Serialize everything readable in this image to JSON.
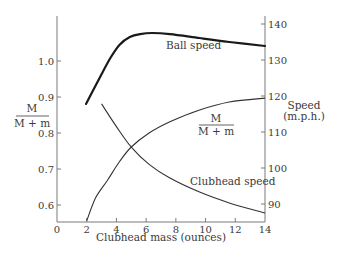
{
  "chart_data": {
    "type": "line",
    "title": "",
    "xlabel": "Clubhead mass (ounces)",
    "ylabel_left": "M / (M + m)",
    "ylabel_left_num": "M",
    "ylabel_left_den": "M + m",
    "ylabel_right": "Speed (m.p.h.)",
    "ylabel_right_line1": "Speed",
    "ylabel_right_line2": "(m.p.h.)",
    "xlim": [
      0,
      14
    ],
    "ylim_left": [
      0.55,
      1.12
    ],
    "ylim_right": [
      84,
      144
    ],
    "x_ticks": [
      0,
      2,
      4,
      6,
      8,
      10,
      12,
      14
    ],
    "y_left_ticks": [
      0.6,
      0.7,
      0.8,
      0.9,
      1.0
    ],
    "y_left_tick_labels": [
      "0.6",
      "0.7",
      "0.8",
      "0.9",
      "1.0"
    ],
    "y_right_ticks": [
      90,
      100,
      110,
      120,
      130,
      140
    ],
    "grid": false,
    "legend": "inline labels",
    "series": [
      {
        "name": "Ball speed",
        "axis": "right",
        "style": "thick",
        "x": [
          1.95,
          2.9,
          3.6,
          4.2,
          4.9,
          5.6,
          6.4,
          7.6,
          9.6,
          11.6,
          14
        ],
        "values": [
          117.8,
          125.3,
          130.6,
          134.2,
          136.4,
          137.2,
          137.5,
          137.2,
          136.1,
          135.0,
          133.9
        ],
        "label_pos": [
          7.6,
          135.5
        ]
      },
      {
        "name": "M / (M + m)",
        "axis": "left",
        "style": "thin",
        "x": [
          2.0,
          2.6,
          3.4,
          4.2,
          5.0,
          6.2,
          7.6,
          9.6,
          11.6,
          14
        ],
        "values": [
          0.556,
          0.62,
          0.669,
          0.72,
          0.761,
          0.8,
          0.831,
          0.864,
          0.886,
          0.897
        ],
        "label_num": "M",
        "label_den": "M + m"
      },
      {
        "name": "Clubhead speed",
        "axis": "right",
        "style": "thin",
        "x": [
          3.0,
          4.0,
          5.0,
          6.2,
          7.6,
          9.6,
          11.6,
          14
        ],
        "values": [
          117.8,
          111.5,
          105.8,
          101.0,
          97.2,
          93.3,
          90.3,
          87.5
        ]
      }
    ]
  }
}
